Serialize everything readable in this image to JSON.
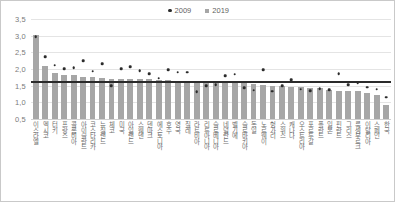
{
  "chart_data": {
    "type": "bar",
    "title": "",
    "xlabel": "",
    "ylabel": "",
    "ylim": [
      0.5,
      3.5
    ],
    "grid": true,
    "legend_position": "top-center",
    "ytick_labels": [
      "3,5",
      "3,0",
      "2,5",
      "2,0",
      "1,5",
      "1,0",
      "0,5"
    ],
    "ytick_values": [
      3.5,
      3.0,
      2.5,
      2.0,
      1.5,
      1.0,
      0.5
    ],
    "reference_line": 1.63,
    "categories": [
      "이스라엘",
      "멕시코",
      "터키",
      "프랑스",
      "콜롬비아",
      "아이슬란드",
      "코스타리카",
      "뉴질랜드",
      "체코",
      "미국",
      "아일랜드",
      "스웨덴",
      "덴마크",
      "에스토니아",
      "호주",
      "영국",
      "칠레",
      "라트비아",
      "리투아니아",
      "슬로베니아",
      "네덜란드",
      "벨기에",
      "슬로바키아",
      "독일",
      "노르웨이",
      "헝가리",
      "스위스",
      "캐나다",
      "오스트리아",
      "포르투갈",
      "폴란드",
      "일본",
      "핀란드",
      "그리스",
      "룩셈부르크",
      "이탈리아",
      "스페인",
      "한국"
    ],
    "series": [
      {
        "name": "2009",
        "marker": "dot",
        "color": "#2b2b2b",
        "values": [
          2.96,
          2.37,
          2.11,
          2.0,
          2.04,
          2.25,
          1.93,
          2.15,
          1.49,
          2.01,
          2.06,
          1.94,
          1.85,
          1.72,
          1.97,
          1.9,
          1.9,
          1.31,
          1.5,
          1.53,
          1.79,
          1.84,
          1.44,
          1.36,
          1.98,
          1.33,
          1.5,
          1.67,
          1.39,
          1.34,
          1.4,
          1.37,
          1.86,
          1.52,
          1.59,
          1.45,
          1.39,
          1.15
        ]
      },
      {
        "name": "2019",
        "marker": "bar",
        "color": "#a6a6a6",
        "values": [
          3.01,
          2.1,
          1.88,
          1.83,
          1.82,
          1.75,
          1.75,
          1.72,
          1.71,
          1.71,
          1.71,
          1.7,
          1.7,
          1.66,
          1.66,
          1.65,
          1.65,
          1.61,
          1.61,
          1.61,
          1.57,
          1.57,
          1.57,
          1.54,
          1.53,
          1.49,
          1.48,
          1.47,
          1.46,
          1.42,
          1.42,
          1.36,
          1.35,
          1.34,
          1.34,
          1.27,
          1.23,
          0.92
        ]
      }
    ]
  },
  "legend": {
    "items": [
      {
        "label": "2009",
        "marker": "dot"
      },
      {
        "label": "2019",
        "marker": "square"
      }
    ]
  }
}
